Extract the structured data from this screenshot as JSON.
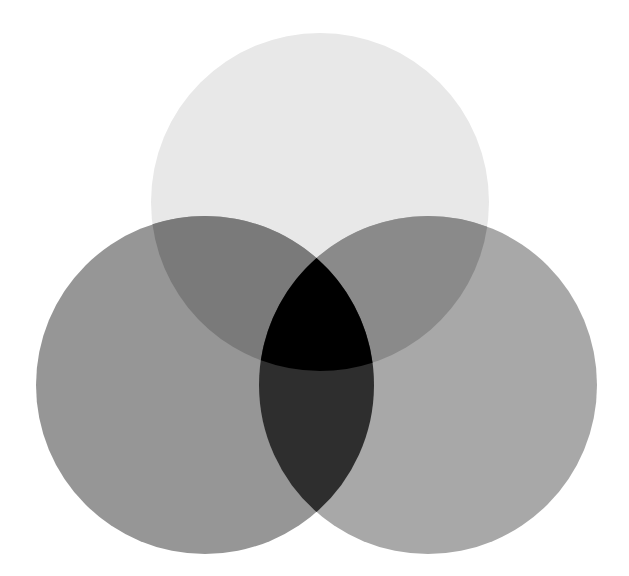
{
  "figure": {
    "caption_fragment": "g                               pp",
    "background_color": "#ffffff",
    "width": 629,
    "height": 576,
    "blend_mode": "multiply"
  },
  "chart_data": {
    "type": "venn",
    "title": "",
    "subtitle": "",
    "xlabel": "",
    "ylabel": "",
    "legend_position": "none",
    "grid": false,
    "canvas": {
      "width": 629,
      "height": 576,
      "background": "#ffffff"
    },
    "sets": [
      {
        "id": "top",
        "name": "Top set",
        "label": "",
        "cx": 320,
        "cy": 202,
        "r": 169,
        "fill": "#e8e8e8",
        "alpha": 1.0
      },
      {
        "id": "left",
        "name": "Left set",
        "label": "",
        "cx": 205,
        "cy": 385,
        "r": 169,
        "fill": "#969696",
        "alpha": 1.0
      },
      {
        "id": "right",
        "name": "Right set",
        "label": "",
        "cx": 428,
        "cy": 385,
        "r": 169,
        "fill": "#a8a8a8",
        "alpha": 1.0
      }
    ],
    "regions": [
      {
        "id": "top-only",
        "members": [
          "top"
        ],
        "fill": "#e8e8e8",
        "value": null
      },
      {
        "id": "left-only",
        "members": [
          "left"
        ],
        "fill": "#969696",
        "value": null
      },
      {
        "id": "right-only",
        "members": [
          "right"
        ],
        "fill": "#a8a8a8",
        "value": null
      },
      {
        "id": "top-left",
        "members": [
          "top",
          "left"
        ],
        "fill": "#7a7a7a",
        "value": null
      },
      {
        "id": "top-right",
        "members": [
          "top",
          "right"
        ],
        "fill": "#8a8a8a",
        "value": null
      },
      {
        "id": "left-right",
        "members": [
          "left",
          "right"
        ],
        "fill": "#2e2e2e",
        "value": null
      },
      {
        "id": "top-left-right",
        "members": [
          "top",
          "left",
          "right"
        ],
        "fill": "#000000",
        "value": null
      }
    ],
    "annotations": []
  }
}
